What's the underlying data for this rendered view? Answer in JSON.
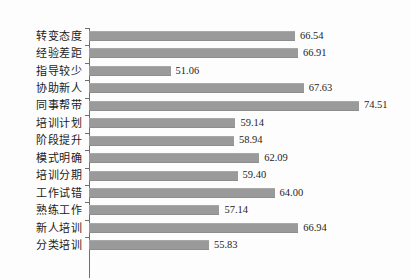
{
  "chart_data": {
    "type": "bar",
    "orientation": "horizontal",
    "title": "",
    "subtitle": "",
    "xlabel": "",
    "ylabel": "",
    "grid": false,
    "legend": null,
    "xlim": [
      40.9,
      79.5
    ],
    "value_format": "0.00",
    "categories": [
      "转变态度",
      "经验差距",
      "指导较少",
      "协助新人",
      "同事帮带",
      "培训计划",
      "阶段提升",
      "模式明确",
      "培训分期",
      "工作试错",
      "熟练工作",
      "新人培训",
      "分类培训"
    ],
    "values": [
      66.54,
      66.91,
      51.06,
      67.63,
      74.51,
      59.14,
      58.94,
      62.09,
      59.4,
      64.0,
      57.14,
      66.94,
      55.83
    ],
    "value_labels": [
      "66.54",
      "66.91",
      "51.06",
      "67.63",
      "74.51",
      "59.14",
      "58.94",
      "62.09",
      "59.40",
      "64.00",
      "57.14",
      "66.94",
      "55.83"
    ],
    "colors": {
      "bar": "#9a9a9a",
      "axis": "#6f6f6f",
      "text": "#1b1b1b",
      "background": "#fdfdfd"
    }
  }
}
